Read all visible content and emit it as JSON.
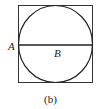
{
  "figure": {
    "caption": "(b)",
    "shapes": [
      "square",
      "inscribed-circle",
      "horizontal-diameter"
    ],
    "labels": {
      "point_a": "A",
      "point_b": "B"
    }
  }
}
